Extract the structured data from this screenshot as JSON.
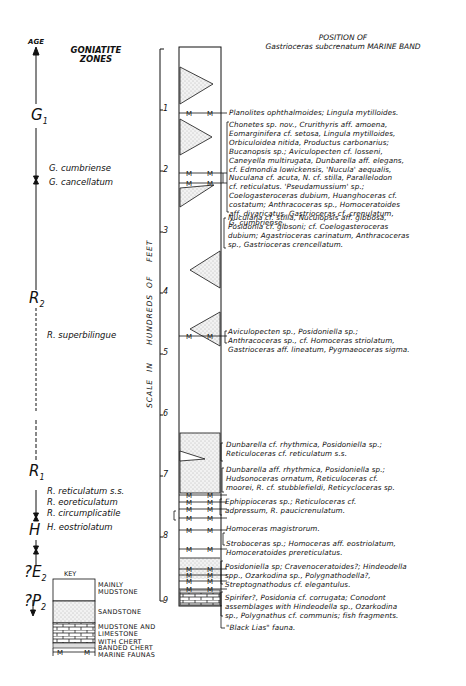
{
  "header": {
    "age_label": "AGE",
    "goniatite_zones_title": [
      "GONIATITE",
      "ZONES"
    ],
    "position_note": [
      "POSITION OF",
      "Gastrioceras subcrenatum MARINE BAND"
    ]
  },
  "age_stages": [
    {
      "symbol": "G",
      "sub": "1"
    },
    {
      "symbol": "R",
      "sub": "2"
    },
    {
      "symbol": "R",
      "sub": "1"
    },
    {
      "symbol": "H",
      "sub": ""
    },
    {
      "symbol": "?E",
      "sub": "2"
    },
    {
      "symbol": "?P",
      "sub": "2"
    }
  ],
  "goniatite_zones": [
    "G. cumbriense",
    "G. cancellatum",
    "R. superbilingue",
    "R. reticulatum s.s.",
    "R. eoreticulatum",
    "R. circumplicatile",
    "H. eostriolatum"
  ],
  "scale": {
    "label": "SCALE IN HUNDREDS OF FEET",
    "words": [
      "SCALE",
      "IN",
      "HUNDREDS",
      "OF",
      "FEET"
    ],
    "ticks": [
      "1",
      "2",
      "3",
      "4",
      "5",
      "6",
      "7",
      "8",
      "9"
    ]
  },
  "column_marker": "M",
  "faunas": [
    {
      "lines": [
        "Planolites ophthalmoides; Lingula mytilloides."
      ]
    },
    {
      "lines": [
        "Chonetes sp. nov., Crurithyris aff. amoena,",
        "Eomarginifera cf. setosa, Lingula mytilloides,",
        "Orbiculoidea nitida, Productus carbonarius;",
        "Bucanopsis sp.; Aviculopecten cf. losseni,",
        "Caneyella multirugata, Dunbarella aff. elegans,",
        "cf. Edmondia lowickensis, 'Nucula' aequalis,",
        "Nuculana cf. acuta, N. cf. stilla, Parallelodon",
        "cf. reticulatus. 'Pseudamussium' sp.;",
        "Coelogasteroceras dubium, Huanghoceras cf.",
        "costatum; Anthracoceras sp., Homoceratoides",
        "aff. divaricatus, Gastrioceras cf. crenulatum,",
        "G. cumbriense."
      ]
    },
    {
      "lines": [
        "Nuculana cf. stilla, Nuculopsis aff. gibbosa,",
        "Posidonia cf. gibsoni; cf. Coelogasteroceras",
        "dubium; Agastrioceras carinatum, Anthracoceras",
        "sp., Gastrioceras crencellatum."
      ]
    },
    {
      "lines": [
        "Aviculopecten sp., Posidoniella sp.;",
        "Anthracoceras sp., cf. Homoceras striolatum,",
        "Gastrioceras aff. lineatum, Pygmaeoceras sigma."
      ]
    },
    {
      "lines": [
        "Dunbarella cf. rhythmica, Posidoniella sp.;",
        "Reticuloceras cf. reticulatum s.s."
      ]
    },
    {
      "lines": [
        "Dunbarella aff. rhythmica, Posidoniella sp.;",
        "Hudsonoceras ornatum, Reticuloceras cf.",
        "moorei, R. cf. stubblefieldi, Reticycloceras sp."
      ]
    },
    {
      "lines": [
        "Ephippioceras sp.; Reticuloceras cf.",
        "adpressum, R. paucicrenulatum."
      ]
    },
    {
      "lines": [
        "Homoceras magistrorum."
      ]
    },
    {
      "lines": [
        "Stroboceras sp.; Homoceras aff. eostriolatum,",
        "Homoceratoides prereticulatus."
      ]
    },
    {
      "lines": [
        "Posidoniella sp; Cravenoceratoides?; Hindeodella",
        "spp., Ozarkodina sp., Polygnathodella?,",
        "Streptognathodus cf. elegantulus."
      ]
    },
    {
      "lines": [
        "Spirifer?, Posidonia cf. corrugata; Conodont",
        "assemblages with Hindeodella sp., Ozarkodina",
        "sp., Polygnathus cf. communis; fish fragments."
      ]
    },
    {
      "lines": [
        "\"Black Lias\" fauna."
      ]
    }
  ],
  "key": {
    "title": "KEY",
    "items": [
      {
        "label": [
          "MAINLY",
          "MUDSTONE"
        ],
        "pattern": "blank"
      },
      {
        "label": [
          "SANDSTONE"
        ],
        "pattern": "stipple"
      },
      {
        "label": [
          "MUDSTONE AND",
          "LIMESTONE",
          "WITH CHERT"
        ],
        "pattern": "brick"
      },
      {
        "label": [
          "BANDED CHERT"
        ],
        "pattern": "banded"
      },
      {
        "label": [
          "MARINE FAUNAS"
        ],
        "pattern": "marine-band"
      }
    ]
  }
}
